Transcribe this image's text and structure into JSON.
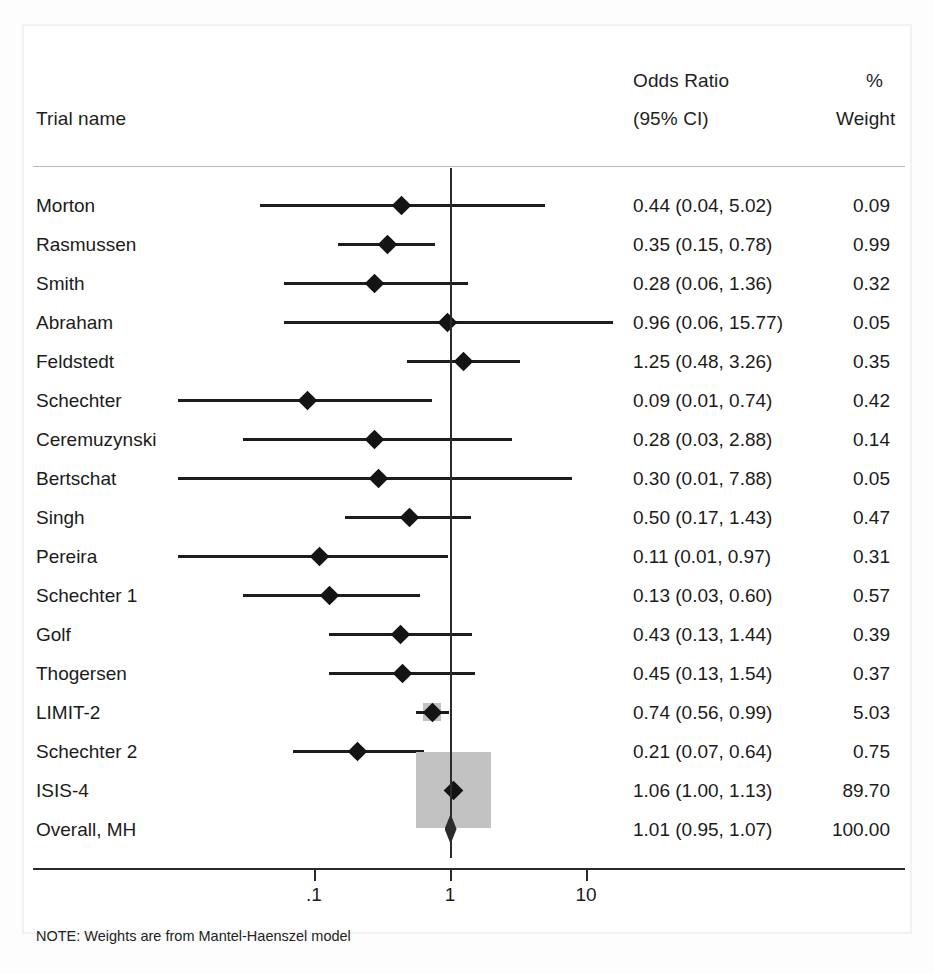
{
  "figure": {
    "type": "forest-plot",
    "headers": {
      "trial_name": "Trial name",
      "or_line1": "Odds Ratio",
      "or_line2": "(95% CI)",
      "weight_line1": "%",
      "weight_line2": "Weight"
    },
    "note": "NOTE: Weights are from Mantel-Haenszel model",
    "axis": {
      "scale": "log10",
      "ticks": [
        ".1",
        "1",
        "10"
      ],
      "tick_values": [
        0.1,
        1,
        10
      ],
      "reference_line": 1
    },
    "colors": {
      "text": "#1b1b1b",
      "line": "#1d1d1d",
      "weight_box": "#c2c2c2",
      "background": "#ffffff",
      "rule": "#2a2a2a"
    }
  },
  "chart_data": {
    "type": "scatter",
    "title": "",
    "xlabel": "",
    "ylabel": "",
    "xscale": "log",
    "xlim": [
      0.01,
      20
    ],
    "grid": false,
    "legend": null,
    "columns": [
      "Trial name",
      "Odds Ratio (95% CI)",
      "% Weight"
    ],
    "rows": [
      {
        "trial": "Morton",
        "or": 0.44,
        "lo": 0.04,
        "hi": 5.02,
        "ci_text": "0.44 (0.04, 5.02)",
        "weight": 0.09,
        "weight_text": "0.09",
        "marker": "diamond"
      },
      {
        "trial": "Rasmussen",
        "or": 0.35,
        "lo": 0.15,
        "hi": 0.78,
        "ci_text": "0.35 (0.15, 0.78)",
        "weight": 0.99,
        "weight_text": "0.99",
        "marker": "diamond"
      },
      {
        "trial": "Smith",
        "or": 0.28,
        "lo": 0.06,
        "hi": 1.36,
        "ci_text": "0.28 (0.06, 1.36)",
        "weight": 0.32,
        "weight_text": "0.32",
        "marker": "diamond"
      },
      {
        "trial": "Abraham",
        "or": 0.96,
        "lo": 0.06,
        "hi": 15.77,
        "ci_text": "0.96 (0.06, 15.77)",
        "weight": 0.05,
        "weight_text": "0.05",
        "marker": "diamond"
      },
      {
        "trial": "Feldstedt",
        "or": 1.25,
        "lo": 0.48,
        "hi": 3.26,
        "ci_text": "1.25 (0.48, 3.26)",
        "weight": 0.35,
        "weight_text": "0.35",
        "marker": "diamond"
      },
      {
        "trial": "Schechter",
        "or": 0.09,
        "lo": 0.01,
        "hi": 0.74,
        "ci_text": "0.09 (0.01, 0.74)",
        "weight": 0.42,
        "weight_text": "0.42",
        "marker": "diamond"
      },
      {
        "trial": "Ceremuzynski",
        "or": 0.28,
        "lo": 0.03,
        "hi": 2.88,
        "ci_text": "0.28 (0.03, 2.88)",
        "weight": 0.14,
        "weight_text": "0.14",
        "marker": "diamond"
      },
      {
        "trial": "Bertschat",
        "or": 0.3,
        "lo": 0.01,
        "hi": 7.88,
        "ci_text": "0.30 (0.01, 7.88)",
        "weight": 0.05,
        "weight_text": "0.05",
        "marker": "diamond"
      },
      {
        "trial": "Singh",
        "or": 0.5,
        "lo": 0.17,
        "hi": 1.43,
        "ci_text": "0.50 (0.17, 1.43)",
        "weight": 0.47,
        "weight_text": "0.47",
        "marker": "diamond"
      },
      {
        "trial": "Pereira",
        "or": 0.11,
        "lo": 0.01,
        "hi": 0.97,
        "ci_text": "0.11 (0.01, 0.97)",
        "weight": 0.31,
        "weight_text": "0.31",
        "marker": "diamond"
      },
      {
        "trial": "Schechter 1",
        "or": 0.13,
        "lo": 0.03,
        "hi": 0.6,
        "ci_text": "0.13 (0.03, 0.60)",
        "weight": 0.57,
        "weight_text": "0.57",
        "marker": "diamond"
      },
      {
        "trial": "Golf",
        "or": 0.43,
        "lo": 0.13,
        "hi": 1.44,
        "ci_text": "0.43 (0.13, 1.44)",
        "weight": 0.39,
        "weight_text": "0.39",
        "marker": "diamond"
      },
      {
        "trial": "Thogersen",
        "or": 0.45,
        "lo": 0.13,
        "hi": 1.54,
        "ci_text": "0.45 (0.13, 1.54)",
        "weight": 0.37,
        "weight_text": "0.37",
        "marker": "diamond"
      },
      {
        "trial": "LIMIT-2",
        "or": 0.74,
        "lo": 0.56,
        "hi": 0.99,
        "ci_text": "0.74 (0.56, 0.99)",
        "weight": 5.03,
        "weight_text": "5.03",
        "marker": "diamond"
      },
      {
        "trial": "Schechter 2",
        "or": 0.21,
        "lo": 0.07,
        "hi": 0.64,
        "ci_text": "0.21 (0.07, 0.64)",
        "weight": 0.75,
        "weight_text": "0.75",
        "marker": "diamond"
      },
      {
        "trial": "ISIS-4",
        "or": 1.06,
        "lo": 1.0,
        "hi": 1.13,
        "ci_text": "1.06 (1.00, 1.13)",
        "weight": 89.7,
        "weight_text": "89.70",
        "marker": "diamond"
      },
      {
        "trial": "Overall, MH",
        "or": 1.01,
        "lo": 0.95,
        "hi": 1.07,
        "ci_text": "1.01 (0.95, 1.07)",
        "weight": 100.0,
        "weight_text": "100.00",
        "marker": "summary-diamond"
      }
    ]
  }
}
